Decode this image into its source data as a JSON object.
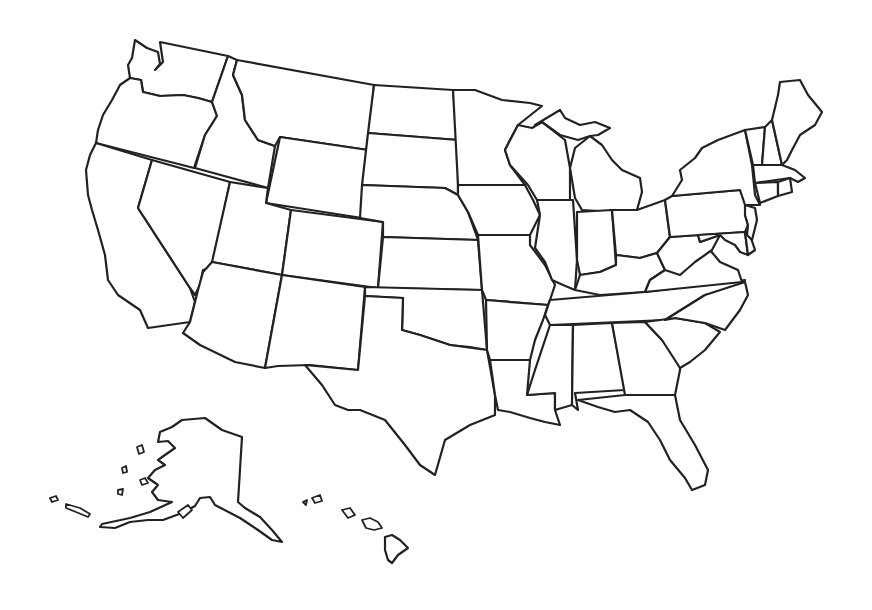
{
  "map": {
    "title": "",
    "type": "blank outline map",
    "region": "United States",
    "background": "#ffffff",
    "stroke_color": "#222222",
    "fill_color": "#ffffff",
    "labels_visible": false,
    "states": [
      {
        "id": "WA",
        "name": "Washington",
        "points": "135,40 147,48 158,52 160,64 155,70 163,62 160,42 228,56 212,102 198,98 183,95 160,96 143,92 141,80 130,78 128,65 132,58"
      },
      {
        "id": "OR",
        "name": "Oregon",
        "points": "130,78 141,80 143,92 160,96 183,95 198,98 212,102 217,116 205,135 194,168 96,143 98,130 103,115 112,100 120,85"
      },
      {
        "id": "CA",
        "name": "California",
        "points": "96,143 152,160 138,208 190,288 195,302 190,322 148,328 140,310 118,295 108,280 105,255 98,230 92,210 88,195 86,170 90,155"
      },
      {
        "id": "ID",
        "name": "Idaho",
        "points": "228,56 237,60 233,75 242,95 245,120 258,140 275,146 268,188 195,168 205,135 217,116 212,102"
      },
      {
        "id": "NV",
        "name": "Nevada",
        "points": "152,160 230,182 212,268 203,270 200,285 195,295 190,288 138,208"
      },
      {
        "id": "MT",
        "name": "Montana",
        "points": "237,60 374,85 368,150 280,137 275,146 258,140 245,120 242,95 233,75"
      },
      {
        "id": "WY",
        "name": "Wyoming",
        "points": "280,137 368,150 362,218 266,203"
      },
      {
        "id": "UT",
        "name": "Utah",
        "points": "230,182 268,188 266,203 291,210 282,275 212,262"
      },
      {
        "id": "AZ",
        "name": "Arizona",
        "points": "212,262 282,275 265,368 235,362 200,345 183,333 190,322 195,302 198,290 203,272"
      },
      {
        "id": "CO",
        "name": "Colorado",
        "points": "291,210 383,222 378,288 282,275"
      },
      {
        "id": "NM",
        "name": "New Mexico",
        "points": "282,275 365,287 358,370 310,365 278,366 265,368"
      },
      {
        "id": "ND",
        "name": "North Dakota",
        "points": "374,85 453,90 458,140 368,133"
      },
      {
        "id": "SD",
        "name": "South Dakota",
        "points": "368,133 458,140 458,195 445,188 362,185"
      },
      {
        "id": "NE",
        "name": "Nebraska",
        "points": "362,185 445,188 458,195 468,212 478,240 383,237 383,222 360,218"
      },
      {
        "id": "KS",
        "name": "Kansas",
        "points": "383,237 478,240 482,290 378,288"
      },
      {
        "id": "OK",
        "name": "Oklahoma",
        "points": "365,287 482,290 487,350 470,347 450,345 420,335 402,330 403,298 365,296"
      },
      {
        "id": "TX",
        "name": "Texas",
        "points": "365,296 403,298 402,330 420,335 450,345 487,350 495,395 495,415 470,425 445,440 435,475 420,465 405,445 385,420 360,410 348,410 335,405 322,385 305,365 358,370"
      },
      {
        "id": "MN",
        "name": "Minnesota",
        "points": "453,90 475,90 502,100 530,103 542,106 518,125 510,140 505,150 510,165 525,185 458,185"
      },
      {
        "id": "IA",
        "name": "Iowa",
        "points": "458,185 525,185 533,200 540,215 530,235 478,235 468,212 458,195"
      },
      {
        "id": "MO",
        "name": "Missouri",
        "points": "478,235 530,235 530,245 545,265 555,285 550,300 548,305 486,300 482,290"
      },
      {
        "id": "AR",
        "name": "Arkansas",
        "points": "486,300 548,305 543,320 535,340 530,360 490,360 487,350"
      },
      {
        "id": "LA",
        "name": "Louisiana",
        "points": "490,360 530,360 527,395 555,393 555,410 560,425 545,422 530,418 510,412 498,410 495,395"
      },
      {
        "id": "WI",
        "name": "Wisconsin",
        "points": "505,150 518,125 532,128 542,122 565,140 570,168 570,200 537,200 528,185 510,165"
      },
      {
        "id": "IL",
        "name": "Illinois",
        "points": "537,200 573,200 577,260 575,290 563,285 552,280 545,262 535,248 540,215"
      },
      {
        "id": "MI",
        "name": "Michigan",
        "points": "570,168 575,148 590,136 602,145 612,160 622,170 640,178 642,192 637,210 615,212 582,210 575,198"
      },
      {
        "id": "MI-UP",
        "name": "Michigan Upper Peninsula",
        "points": "535,125 560,110 565,118 580,125 595,122 610,128 598,135 590,136 578,140 560,135 542,122"
      },
      {
        "id": "IN",
        "name": "Indiana",
        "points": "577,212 612,210 616,265 600,272 580,275 577,260"
      },
      {
        "id": "OH",
        "name": "Ohio",
        "points": "612,210 637,210 665,200 670,237 657,253 640,258 616,255"
      },
      {
        "id": "KY",
        "name": "Kentucky",
        "points": "575,290 580,275 600,272 616,265 616,255 640,258 657,253 665,270 650,280 645,292 600,295"
      },
      {
        "id": "TN",
        "name": "Tennessee",
        "points": "550,300 645,292 745,280 735,290 705,295 665,320 550,325 545,315"
      },
      {
        "id": "MS",
        "name": "Mississippi",
        "points": "550,325 573,325 572,405 555,410 555,393 527,395 535,370"
      },
      {
        "id": "AL",
        "name": "Alabama",
        "points": "573,325 612,323 625,390 575,393 578,410 572,405"
      },
      {
        "id": "GA",
        "name": "Georgia",
        "points": "612,323 645,322 662,340 680,360 680,370 675,395 625,395"
      },
      {
        "id": "FL",
        "name": "Florida",
        "points": "578,400 625,395 675,395 680,420 695,445 708,470 705,485 692,490 685,478 670,460 660,440 648,422 630,410 615,412 598,407"
      },
      {
        "id": "SC",
        "name": "South Carolina",
        "points": "645,322 675,318 705,323 720,332 705,350 690,362 680,368 662,340"
      },
      {
        "id": "NC",
        "name": "North Carolina",
        "points": "665,320 705,295 745,282 748,295 740,310 725,330 705,323 675,318"
      },
      {
        "id": "VA",
        "name": "Virginia",
        "points": "645,292 650,280 665,270 682,265 710,250 720,262 738,270 742,282"
      },
      {
        "id": "WV",
        "name": "West Virginia",
        "points": "657,253 670,237 698,235 700,242 720,235 712,250 695,262 680,275 665,270"
      },
      {
        "id": "PA",
        "name": "Pennsylvania",
        "points": "665,200 672,196 740,190 748,200 745,215 748,225 745,232 670,237"
      },
      {
        "id": "MD",
        "name": "Maryland",
        "points": "698,235 745,232 748,255 740,252 735,245 725,240 720,235 700,242"
      },
      {
        "id": "DE",
        "name": "Delaware",
        "points": "745,232 750,235 755,250 748,255"
      },
      {
        "id": "NJ",
        "name": "New Jersey",
        "points": "745,205 755,208 757,220 752,240 747,235 748,225 745,215"
      },
      {
        "id": "NY",
        "name": "New York",
        "points": "672,196 682,180 680,170 695,158 702,148 718,140 745,130 752,165 755,195 760,205 745,205 740,190"
      },
      {
        "id": "VT",
        "name": "Vermont",
        "points": "745,130 765,127 762,165 753,165"
      },
      {
        "id": "NH",
        "name": "New Hampshire",
        "points": "765,127 772,120 782,165 762,165"
      },
      {
        "id": "ME",
        "name": "Maine",
        "points": "772,120 778,95 780,82 800,80 808,95 822,112 815,125 800,135 792,150 787,160 782,165"
      },
      {
        "id": "MA",
        "name": "Massachusetts",
        "points": "753,165 782,165 795,170 805,178 798,182 790,178 755,183"
      },
      {
        "id": "CT",
        "name": "Connecticut",
        "points": "755,183 778,182 778,196 760,203"
      },
      {
        "id": "RI",
        "name": "Rhode Island",
        "points": "778,182 790,178 792,192 778,196"
      },
      {
        "id": "AK",
        "name": "Alaska",
        "points": "172,427 182,420 205,418 222,430 242,437 238,502 245,508 260,517 272,530 282,542 272,540 258,530 240,518 215,505 210,497 200,498 195,506 182,513 163,520 148,520 130,522 115,528 100,527 102,524 130,518 150,512 172,502 158,500 152,492 158,485 148,478 155,470 165,465 158,460 165,455 175,448 168,441 158,442 160,432"
      },
      {
        "id": "HI",
        "name": "Hawaii Big Island",
        "points": "385,537 392,535 400,540 408,548 398,555 392,563 388,560 385,550"
      }
    ],
    "islands": [
      {
        "id": "HI-maui",
        "points": "362,520 370,518 378,522 382,528 374,530 366,528"
      },
      {
        "id": "HI-oahu",
        "points": "342,510 350,508 355,515 348,518"
      },
      {
        "id": "HI-kauai",
        "points": "312,498 320,495 322,501 315,503"
      },
      {
        "id": "HI-niihau",
        "points": "303,502 307,500 306,505"
      },
      {
        "id": "AK-island-1",
        "points": "137,447 142,445 144,452 139,454"
      },
      {
        "id": "AK-island-2",
        "points": "122,468 126,466 127,472 123,473"
      },
      {
        "id": "AK-island-3",
        "points": "140,480 145,478 148,483 142,485"
      },
      {
        "id": "AK-island-4",
        "points": "118,490 123,489 122,495 118,494"
      },
      {
        "id": "AK-aleutian-1",
        "points": "50,498 56,496 58,500 52,502"
      },
      {
        "id": "AK-aleutian-2",
        "points": "66,504 80,508 90,514 88,517 76,512 66,508"
      },
      {
        "id": "AK-kodiak",
        "points": "178,512 188,505 192,510 183,518"
      }
    ]
  }
}
